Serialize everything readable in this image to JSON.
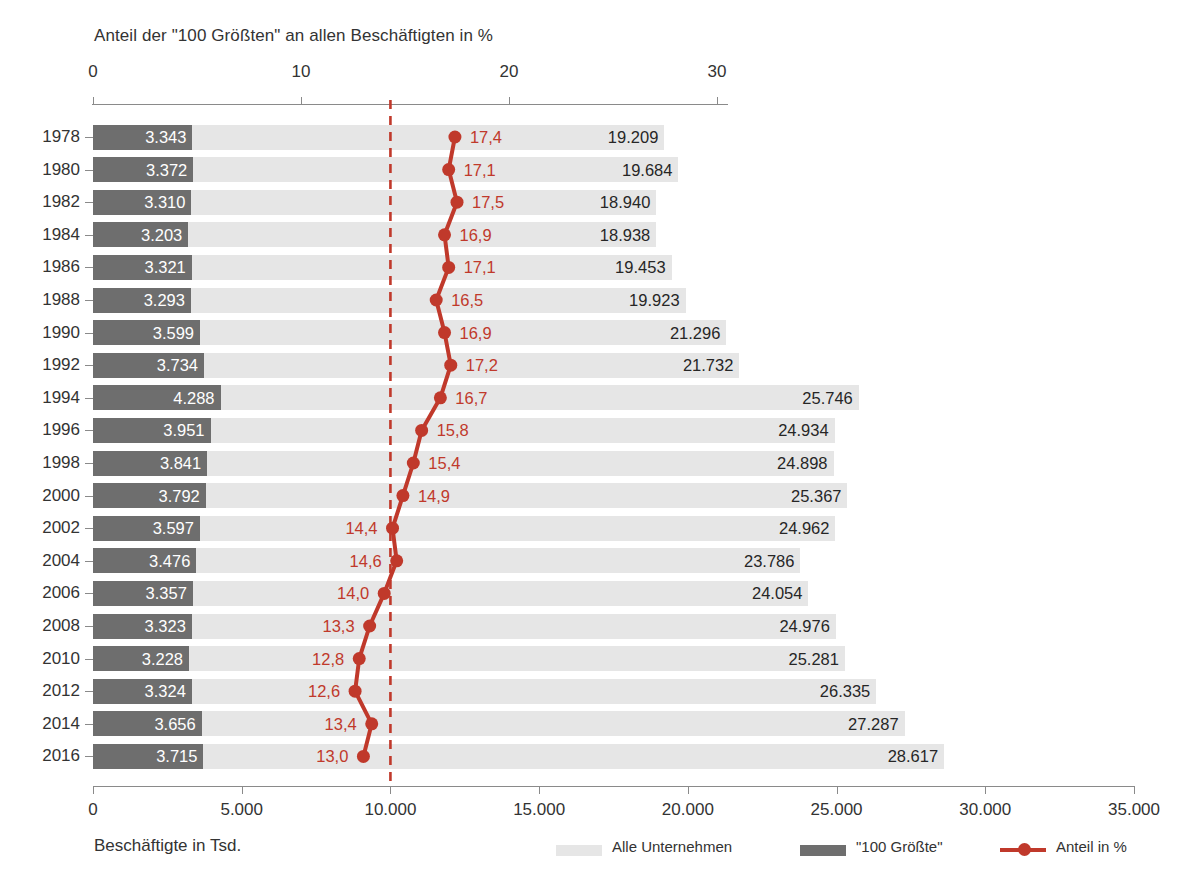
{
  "chart_data": {
    "type": "bar",
    "title": "Anteil der \"100 Größten\" an allen Beschäftigten in %",
    "xlabel_bottom": "Beschäftigte in Tsd.",
    "top_axis": {
      "label": "Anteil der \"100 Größten\" an allen Beschäftigten in %",
      "ticks": [
        "0",
        "10",
        "20",
        "30"
      ],
      "tick_values": [
        0,
        10,
        20,
        30
      ],
      "range": [
        0,
        33.3
      ]
    },
    "bottom_axis": {
      "label": "Beschäftigte in Tsd.",
      "ticks": [
        "0",
        "5.000",
        "10.000",
        "15.000",
        "20.000",
        "25.000",
        "30.000",
        "35.000"
      ],
      "tick_values": [
        0,
        5000,
        10000,
        15000,
        20000,
        25000,
        30000,
        35000
      ],
      "range": [
        0,
        35000
      ]
    },
    "reference_line": {
      "value": 10000,
      "color": "#c0392b",
      "style": "dashed"
    },
    "categories": [
      "1978",
      "1980",
      "1982",
      "1984",
      "1986",
      "1988",
      "1990",
      "1992",
      "1994",
      "1996",
      "1998",
      "2000",
      "2002",
      "2004",
      "2006",
      "2008",
      "2010",
      "2012",
      "2014",
      "2016"
    ],
    "series": [
      {
        "name": "Alle Unternehmen",
        "type": "bar",
        "color": "#e6e6e6",
        "axis": "bottom",
        "values": [
          19209,
          19684,
          18940,
          18938,
          19453,
          19923,
          21296,
          21732,
          25746,
          24934,
          24898,
          25367,
          24962,
          23786,
          24054,
          24976,
          25281,
          26335,
          27287,
          28617
        ],
        "labels": [
          "19.209",
          "19.684",
          "18.940",
          "18.938",
          "19.453",
          "19.923",
          "21.296",
          "21.732",
          "25.746",
          "24.934",
          "24.898",
          "25.367",
          "24.962",
          "23.786",
          "24.054",
          "24.976",
          "25.281",
          "26.335",
          "27.287",
          "28.617"
        ]
      },
      {
        "name": "\"100 Größte\"",
        "type": "bar",
        "color": "#6e6e6e",
        "axis": "bottom",
        "values": [
          3343,
          3372,
          3310,
          3203,
          3321,
          3293,
          3599,
          3734,
          4288,
          3951,
          3841,
          3792,
          3597,
          3476,
          3357,
          3323,
          3228,
          3324,
          3656,
          3715
        ],
        "labels": [
          "3.343",
          "3.372",
          "3.310",
          "3.203",
          "3.321",
          "3.293",
          "3.599",
          "3.734",
          "4.288",
          "3.951",
          "3.841",
          "3.792",
          "3.597",
          "3.476",
          "3.357",
          "3.323",
          "3.228",
          "3.324",
          "3.656",
          "3.715"
        ]
      },
      {
        "name": "Anteil in %",
        "type": "line",
        "color": "#c0392b",
        "axis": "top",
        "values": [
          17.4,
          17.1,
          17.5,
          16.9,
          17.1,
          16.5,
          16.9,
          17.2,
          16.7,
          15.8,
          15.4,
          14.9,
          14.4,
          14.6,
          14.0,
          13.3,
          12.8,
          12.6,
          13.4,
          13.0
        ],
        "labels": [
          "17,4",
          "17,1",
          "17,5",
          "16,9",
          "17,1",
          "16,5",
          "16,9",
          "17,2",
          "16,7",
          "15,8",
          "15,4",
          "14,9",
          "14,4",
          "14,6",
          "14,0",
          "13,3",
          "12,8",
          "12,6",
          "13,4",
          "13,0"
        ],
        "label_side": [
          "right",
          "right",
          "right",
          "right",
          "right",
          "right",
          "right",
          "right",
          "right",
          "right",
          "right",
          "right",
          "left",
          "left",
          "left",
          "left",
          "left",
          "left",
          "left",
          "left"
        ]
      }
    ],
    "legend": {
      "position": "bottom",
      "entries": [
        {
          "label": "Alle Unternehmen",
          "color": "#e6e6e6",
          "marker": "square"
        },
        {
          "label": "\"100 Größte\"",
          "color": "#6e6e6e",
          "marker": "square"
        },
        {
          "label": "Anteil in %",
          "color": "#c0392b",
          "marker": "line-dot"
        }
      ]
    },
    "grid": false,
    "colors": {
      "all_companies": "#e6e6e6",
      "top_100": "#6e6e6e",
      "share_line": "#c0392b",
      "axis": "#8a8a8a",
      "text": "#333333"
    }
  }
}
